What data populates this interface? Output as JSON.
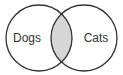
{
  "diagram": {
    "type": "venn",
    "sets": [
      {
        "label": "Dogs",
        "cx": 39,
        "cy": 38,
        "r": 33
      },
      {
        "label": "Cats",
        "cx": 84,
        "cy": 38,
        "r": 33
      }
    ],
    "intersection": {
      "shaded": true,
      "fill": "#d6d6d6"
    },
    "stroke": "#333333",
    "background": "#ffffff"
  }
}
